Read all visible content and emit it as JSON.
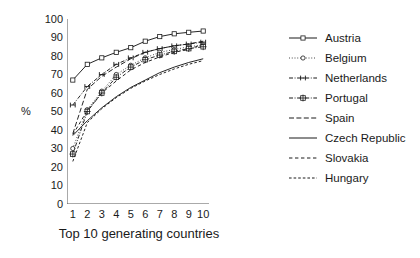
{
  "chart_data": {
    "type": "line",
    "title": "",
    "xlabel": "Top 10 generating countries",
    "ylabel": "%",
    "x": [
      1,
      2,
      3,
      4,
      5,
      6,
      7,
      8,
      9,
      10
    ],
    "xlim": [
      0.6,
      10.4
    ],
    "ylim": [
      0,
      100
    ],
    "xticks": [
      "1",
      "2",
      "3",
      "4",
      "5",
      "6",
      "7",
      "8",
      "9",
      "10"
    ],
    "yticks": [
      "0",
      "10",
      "20",
      "30",
      "40",
      "50",
      "60",
      "70",
      "80",
      "90",
      "100"
    ],
    "grid": false,
    "legend_position": "right",
    "series": [
      {
        "name": "Austria",
        "values": [
          67,
          75.5,
          79,
          82,
          84.5,
          88,
          90.5,
          92,
          92.8,
          93.5
        ],
        "marker": "square",
        "dash": "none"
      },
      {
        "name": "Belgium",
        "values": [
          30,
          51,
          61,
          70,
          75,
          79,
          82,
          83.5,
          85,
          86
        ],
        "marker": "circle",
        "dash": "dotted"
      },
      {
        "name": "Netherlands",
        "values": [
          53.5,
          63.5,
          70,
          75.5,
          79,
          82,
          84,
          85.5,
          86.5,
          87.5
        ],
        "marker": "h-bar",
        "dash": "dash-dot"
      },
      {
        "name": "Portugal",
        "values": [
          27,
          50,
          60,
          68.5,
          74,
          78,
          80.5,
          82.5,
          84,
          85
        ],
        "marker": "plus-square",
        "dash": "dash-dot"
      },
      {
        "name": "Spain",
        "values": [
          38,
          62,
          69,
          74,
          78.5,
          82,
          84,
          85.5,
          86.5,
          88
        ],
        "marker": "none",
        "dash": "dashed"
      },
      {
        "name": "Czech Republic",
        "values": [
          37,
          45,
          52,
          58,
          63,
          67,
          71,
          74,
          76.5,
          78.5
        ],
        "marker": "none",
        "dash": "none"
      },
      {
        "name": "Slovakia",
        "values": [
          37.5,
          50.5,
          60,
          66.5,
          72.5,
          76.5,
          79.5,
          82,
          83.5,
          86.5
        ],
        "marker": "none",
        "dash": "sparse-dash"
      },
      {
        "name": "Hungary",
        "values": [
          23,
          44,
          51.5,
          57.5,
          62.5,
          66.5,
          70,
          73,
          75.5,
          77.5
        ],
        "marker": "none",
        "dash": "short-dash"
      }
    ]
  },
  "axes": {
    "y_title": "%",
    "x_title": "Top 10 generating countries"
  },
  "legend": {
    "items": [
      {
        "label": "Austria"
      },
      {
        "label": "Belgium"
      },
      {
        "label": "Netherlands"
      },
      {
        "label": "Portugal"
      },
      {
        "label": "Spain"
      },
      {
        "label": "Czech Republic"
      },
      {
        "label": "Slovakia"
      },
      {
        "label": "Hungary"
      }
    ]
  },
  "colors": {
    "ink": "#1a1a1a",
    "axis": "#555555",
    "background": "#ffffff"
  }
}
